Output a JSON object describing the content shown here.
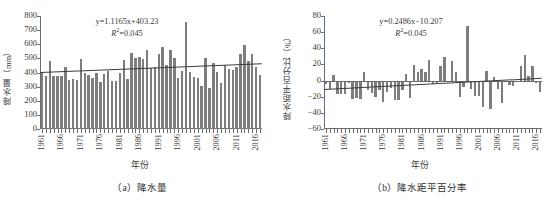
{
  "figure": {
    "panels": [
      {
        "id": "panel-a",
        "caption": "（a）降水量",
        "equation_line1": "y=1.1165x+403.23",
        "equation_line2_prefix": "R",
        "equation_line2_sup": "2",
        "equation_line2_suffix": "=0.045",
        "ylabel": "降水量（mm）",
        "xlabel": "年份"
      },
      {
        "id": "panel-b",
        "caption": "（b）降水距平百分率",
        "equation_line1": "y=0.2486x−10.207",
        "equation_line2_prefix": "R",
        "equation_line2_sup": "2",
        "equation_line2_suffix": "=0.045",
        "ylabel": "降水距平百分比（%）",
        "xlabel": "年份"
      }
    ]
  },
  "chart_data": [
    {
      "type": "bar",
      "title": "（a）降水量",
      "xlabel": "年份",
      "ylabel": "降水量（mm）",
      "ylim": [
        0,
        800
      ],
      "yticks": [
        0,
        100,
        200,
        300,
        400,
        500,
        600,
        700,
        800
      ],
      "xticks": [
        "1961",
        "1966",
        "1971",
        "1976",
        "1981",
        "1986",
        "1991",
        "1996",
        "2001",
        "2006",
        "2011",
        "2016"
      ],
      "grid": false,
      "legend": null,
      "bar_color": "#7d7d7d",
      "trendline": {
        "slope": 1.1165,
        "intercept": 403.23,
        "r_squared": 0.045,
        "label": "y=1.1165x+403.23"
      },
      "x": [
        1961,
        1962,
        1963,
        1964,
        1965,
        1966,
        1967,
        1968,
        1969,
        1970,
        1971,
        1972,
        1973,
        1974,
        1975,
        1976,
        1977,
        1978,
        1979,
        1980,
        1981,
        1982,
        1983,
        1984,
        1985,
        1986,
        1987,
        1988,
        1989,
        1990,
        1991,
        1992,
        1993,
        1994,
        1995,
        1996,
        1997,
        1998,
        1999,
        2000,
        2001,
        2002,
        2003,
        2004,
        2005,
        2006,
        2007,
        2008,
        2009,
        2010,
        2011,
        2012,
        2013,
        2014,
        2015,
        2016,
        2017
      ],
      "values": [
        403,
        378,
        482,
        373,
        372,
        372,
        436,
        346,
        352,
        345,
        498,
        393,
        379,
        361,
        396,
        330,
        388,
        411,
        342,
        342,
        397,
        485,
        357,
        537,
        500,
        512,
        498,
        561,
        430,
        437,
        529,
        580,
        452,
        561,
        500,
        359,
        412,
        755,
        402,
        365,
        364,
        303,
        505,
        292,
        469,
        406,
        323,
        452,
        427,
        420,
        440,
        530,
        594,
        478,
        532,
        438,
        385
      ]
    },
    {
      "type": "bar",
      "title": "（b）降水距平百分率",
      "xlabel": "年份",
      "ylabel": "降水距平百分比（%）",
      "ylim": [
        -60,
        80
      ],
      "yticks": [
        -60,
        -40,
        -20,
        0,
        20,
        40,
        60,
        80
      ],
      "xticks": [
        "1961",
        "1966",
        "1971",
        "1976",
        "1981",
        "1986",
        "1991",
        "1996",
        "2001",
        "2006",
        "2011",
        "2016"
      ],
      "grid": false,
      "legend": null,
      "bar_color": "#7d7d7d",
      "trendline": {
        "slope": 0.2486,
        "intercept": -10.207,
        "r_squared": 0.045,
        "label": "y=0.2486x−10.207"
      },
      "x": [
        1961,
        1962,
        1963,
        1964,
        1965,
        1966,
        1967,
        1968,
        1969,
        1970,
        1971,
        1972,
        1973,
        1974,
        1975,
        1976,
        1977,
        1978,
        1979,
        1980,
        1981,
        1982,
        1983,
        1984,
        1985,
        1986,
        1987,
        1988,
        1989,
        1990,
        1991,
        1992,
        1993,
        1994,
        1995,
        1996,
        1997,
        1998,
        1999,
        2000,
        2001,
        2002,
        2003,
        2004,
        2005,
        2006,
        2007,
        2008,
        2009,
        2010,
        2011,
        2012,
        2013,
        2014,
        2015,
        2016,
        2017
      ],
      "values": [
        -4,
        -10,
        7,
        -17,
        -17,
        -17,
        -3,
        -23,
        -22,
        -23,
        11,
        -12,
        -16,
        -20,
        -12,
        -27,
        -14,
        -9,
        -24,
        -24,
        -12,
        8,
        -21,
        19,
        11,
        14,
        11,
        25,
        -4,
        -3,
        18,
        29,
        0,
        24,
        11,
        -20,
        -8,
        67,
        -11,
        -19,
        -19,
        -33,
        12,
        -35,
        4,
        -10,
        -28,
        0,
        -5,
        -7,
        -2,
        18,
        32,
        6,
        18,
        -3,
        -14
      ]
    }
  ]
}
